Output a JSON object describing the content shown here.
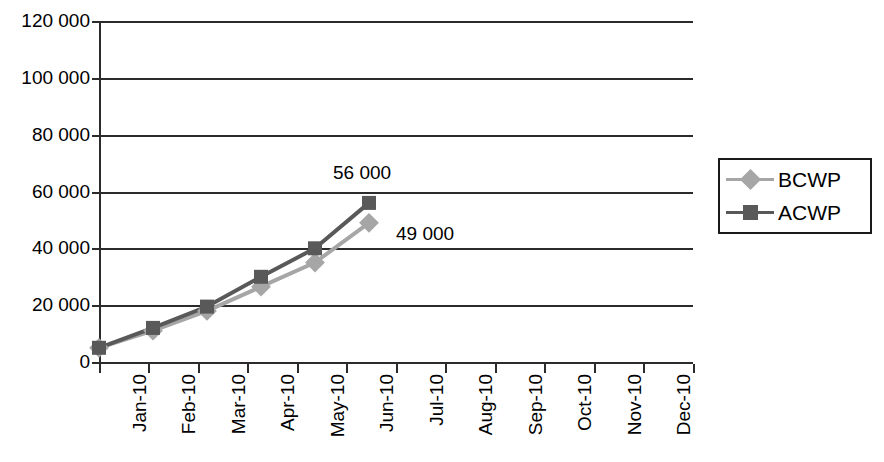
{
  "chart_data": {
    "type": "line",
    "title": "",
    "xlabel": "",
    "ylabel": "",
    "categories": [
      "Jan-10",
      "Feb-10",
      "Mar-10",
      "Apr-10",
      "May-10",
      "Jun-10",
      "Jul-10",
      "Aug-10",
      "Sep-10",
      "Oct-10",
      "Nov-10",
      "Dec-10"
    ],
    "series": [
      {
        "name": "BCWP",
        "color": "#a6a6a6",
        "marker": "diamond",
        "values": [
          5000,
          11000,
          18000,
          26500,
          35000,
          49000,
          null,
          null,
          null,
          null,
          null,
          null
        ]
      },
      {
        "name": "ACWP",
        "color": "#595959",
        "marker": "square",
        "values": [
          5000,
          12000,
          19500,
          30000,
          40000,
          56000,
          null,
          null,
          null,
          null,
          null,
          null
        ]
      }
    ],
    "ylim": [
      0,
      120000
    ],
    "ytick_values": [
      0,
      20000,
      40000,
      60000,
      80000,
      100000,
      120000
    ],
    "ytick_labels": [
      "0",
      "20 000",
      "40 000",
      "60 000",
      "80 000",
      "100 000",
      "120 000"
    ],
    "grid": true,
    "legend_position": "right",
    "annotations": [
      {
        "text": "56 000",
        "series": "ACWP",
        "category": "Jun-10",
        "value": 56000
      },
      {
        "text": "49 000",
        "series": "BCWP",
        "category": "Jun-10",
        "value": 49000
      }
    ]
  },
  "legend": {
    "entries": [
      {
        "label": "BCWP",
        "color": "#a6a6a6",
        "marker": "diamond"
      },
      {
        "label": "ACWP",
        "color": "#595959",
        "marker": "square"
      }
    ]
  },
  "colors": {
    "axis": "#2b2b2b",
    "grid": "#2b2b2b",
    "bcwp": "#a6a6a6",
    "acwp": "#595959",
    "background": "#ffffff",
    "text": "#000000"
  }
}
